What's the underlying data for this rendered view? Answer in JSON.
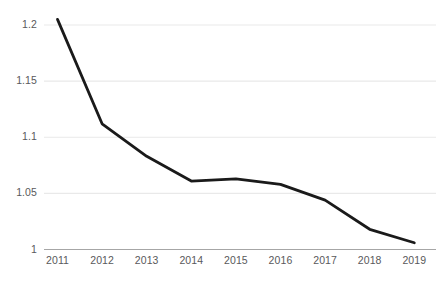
{
  "chart_data": {
    "type": "line",
    "title": "",
    "subtitle": "",
    "xlabel": "",
    "ylabel": "",
    "categories": [
      "2011",
      "2012",
      "2013",
      "2014",
      "2015",
      "2016",
      "2017",
      "2018",
      "2019"
    ],
    "values": [
      1.205,
      1.112,
      1.083,
      1.061,
      1.063,
      1.058,
      1.044,
      1.018,
      1.006
    ],
    "series": [
      {
        "name": "",
        "values": [
          1.205,
          1.112,
          1.083,
          1.061,
          1.063,
          1.058,
          1.044,
          1.018,
          1.006
        ],
        "color": "#1a1a1a",
        "line_width": 2.8,
        "markers": false
      }
    ],
    "ylim": [
      1.0,
      1.2
    ],
    "y_ticks": [
      1.2,
      1.15,
      1.1,
      1.05,
      1.0
    ],
    "y_tick_labels": [
      "1.2",
      "1.15",
      "1.1",
      "1.05",
      "1"
    ],
    "x_tick_labels": [
      "2011",
      "2012",
      "2013",
      "2014",
      "2015",
      "2016",
      "2017",
      "2018",
      "2019"
    ],
    "grid": {
      "horizontal": true,
      "vertical": false,
      "color": "#e9e9e9"
    },
    "axis_line_color": "#a6a6a6",
    "legend": {
      "visible": false,
      "position": "none",
      "entries": []
    },
    "annotations": [],
    "background": "#ffffff",
    "text_color": "#59595b"
  },
  "layout": {
    "plot_left": 44,
    "plot_right": 436,
    "plot_top": 25,
    "plot_bottom": 249.5,
    "x_step": 44.6
  }
}
